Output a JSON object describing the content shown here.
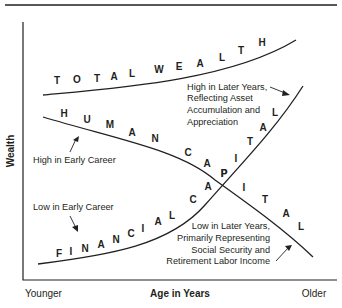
{
  "diagram": {
    "title": "",
    "axes": {
      "y_label": "Wealth",
      "x_label": "Age in Years",
      "x_start_label": "Younger",
      "x_end_label": "Older"
    },
    "curves": {
      "total_wealth": {
        "label": "TOTAL WEALTH",
        "letters": [
          "T",
          "O",
          "T",
          "A",
          "L",
          "W",
          "E",
          "A",
          "L",
          "T",
          "H"
        ]
      },
      "human_capital": {
        "label": "HUMAN CAPITAL",
        "letters": [
          "H",
          "U",
          "M",
          "A",
          "N",
          "C",
          "A",
          "P",
          "I",
          "T",
          "A",
          "L"
        ]
      },
      "financial_capital": {
        "label": "FINANCIAL CAPITAL",
        "letters": [
          "F",
          "I",
          "N",
          "A",
          "N",
          "C",
          "I",
          "A",
          "L",
          "C",
          "A",
          "P",
          "I",
          "T",
          "A",
          "L"
        ]
      }
    },
    "annotations": {
      "human_early": "High in Early Career",
      "financial_early": "Low in Early Career",
      "financial_later": [
        "High in Later Years,",
        "Reflecting Asset",
        "Accumulation and",
        "Appreciation"
      ],
      "human_later": [
        "Low in Later Years,",
        "Primarily Representing",
        "Social Security and",
        "Retirement Labor Income"
      ]
    }
  }
}
